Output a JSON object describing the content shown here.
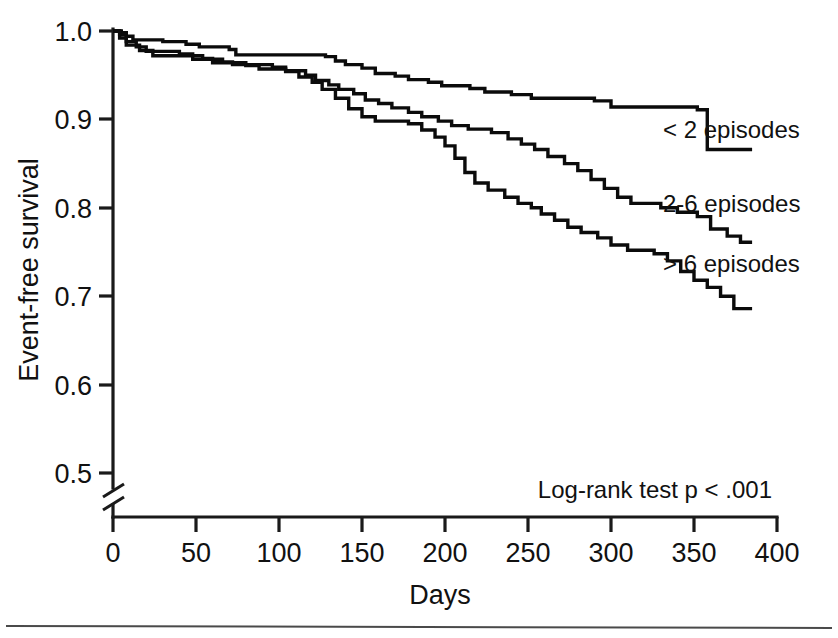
{
  "figure": {
    "title": "",
    "background_color": "#ffffff",
    "line_color": "#0b0b0b",
    "axis_color": "#1a1a1a"
  },
  "axes": {
    "y_title": "Event-free survival",
    "x_title": "Days",
    "y_ticks": [
      "1.0",
      "0.9",
      "0.8",
      "0.7",
      "0.6",
      "0.5"
    ],
    "x_ticks": [
      "0",
      "50",
      "100",
      "150",
      "200",
      "250",
      "300",
      "350",
      "400"
    ],
    "y_axis_break": true
  },
  "annotations": {
    "log_rank": "Log-rank test p < .001"
  },
  "curve_labels": {
    "series_1": "< 2 episodes",
    "series_2": "2-6 episodes",
    "series_3": "> 6 episodes"
  },
  "chart_data": {
    "type": "line",
    "title": "",
    "xlabel": "Days",
    "ylabel": "Event-free survival",
    "xlim": [
      0,
      400
    ],
    "ylim": [
      0.5,
      1.0
    ],
    "y_axis_break_below": 0.5,
    "grid": false,
    "legend_position": "inline-right-of-curves",
    "annotations": [
      "Log-rank test p < .001"
    ],
    "step_type": "post",
    "series": [
      {
        "name": "< 2 episodes",
        "label_position": {
          "x": 320,
          "y": 0.898
        },
        "points": [
          [
            0,
            1.0
          ],
          [
            5,
            0.998
          ],
          [
            8,
            0.994
          ],
          [
            12,
            0.99
          ],
          [
            30,
            0.988
          ],
          [
            44,
            0.985
          ],
          [
            52,
            0.982
          ],
          [
            70,
            0.979
          ],
          [
            74,
            0.973
          ],
          [
            128,
            0.971
          ],
          [
            134,
            0.966
          ],
          [
            140,
            0.962
          ],
          [
            150,
            0.958
          ],
          [
            158,
            0.952
          ],
          [
            170,
            0.949
          ],
          [
            178,
            0.945
          ],
          [
            190,
            0.942
          ],
          [
            198,
            0.938
          ],
          [
            215,
            0.935
          ],
          [
            224,
            0.931
          ],
          [
            240,
            0.928
          ],
          [
            252,
            0.924
          ],
          [
            290,
            0.921
          ],
          [
            300,
            0.914
          ],
          [
            352,
            0.911
          ],
          [
            358,
            0.866
          ],
          [
            385,
            0.866
          ]
        ]
      },
      {
        "name": "2-6 episodes",
        "label_position": {
          "x": 320,
          "y": 0.812
        },
        "points": [
          [
            0,
            1.0
          ],
          [
            4,
            0.996
          ],
          [
            8,
            0.988
          ],
          [
            14,
            0.982
          ],
          [
            20,
            0.977
          ],
          [
            40,
            0.974
          ],
          [
            48,
            0.968
          ],
          [
            66,
            0.965
          ],
          [
            72,
            0.962
          ],
          [
            96,
            0.959
          ],
          [
            104,
            0.955
          ],
          [
            116,
            0.95
          ],
          [
            122,
            0.944
          ],
          [
            130,
            0.939
          ],
          [
            136,
            0.934
          ],
          [
            145,
            0.929
          ],
          [
            152,
            0.922
          ],
          [
            160,
            0.918
          ],
          [
            168,
            0.913
          ],
          [
            178,
            0.908
          ],
          [
            186,
            0.903
          ],
          [
            196,
            0.898
          ],
          [
            204,
            0.893
          ],
          [
            214,
            0.889
          ],
          [
            228,
            0.885
          ],
          [
            238,
            0.878
          ],
          [
            246,
            0.872
          ],
          [
            254,
            0.866
          ],
          [
            262,
            0.858
          ],
          [
            272,
            0.85
          ],
          [
            280,
            0.842
          ],
          [
            288,
            0.832
          ],
          [
            296,
            0.822
          ],
          [
            304,
            0.812
          ],
          [
            312,
            0.805
          ],
          [
            330,
            0.8
          ],
          [
            340,
            0.795
          ],
          [
            352,
            0.79
          ],
          [
            360,
            0.776
          ],
          [
            370,
            0.768
          ],
          [
            378,
            0.761
          ],
          [
            385,
            0.761
          ]
        ]
      },
      {
        "name": "> 6 episodes",
        "label_position": {
          "x": 320,
          "y": 0.742
        },
        "points": [
          [
            0,
            1.0
          ],
          [
            4,
            0.992
          ],
          [
            8,
            0.984
          ],
          [
            16,
            0.978
          ],
          [
            24,
            0.972
          ],
          [
            54,
            0.969
          ],
          [
            60,
            0.964
          ],
          [
            80,
            0.961
          ],
          [
            88,
            0.957
          ],
          [
            104,
            0.954
          ],
          [
            112,
            0.948
          ],
          [
            120,
            0.942
          ],
          [
            126,
            0.934
          ],
          [
            134,
            0.924
          ],
          [
            142,
            0.912
          ],
          [
            150,
            0.903
          ],
          [
            158,
            0.898
          ],
          [
            178,
            0.895
          ],
          [
            186,
            0.888
          ],
          [
            194,
            0.88
          ],
          [
            200,
            0.87
          ],
          [
            206,
            0.856
          ],
          [
            212,
            0.84
          ],
          [
            218,
            0.828
          ],
          [
            226,
            0.82
          ],
          [
            236,
            0.812
          ],
          [
            244,
            0.805
          ],
          [
            252,
            0.8
          ],
          [
            258,
            0.793
          ],
          [
            266,
            0.786
          ],
          [
            274,
            0.778
          ],
          [
            282,
            0.772
          ],
          [
            292,
            0.766
          ],
          [
            300,
            0.758
          ],
          [
            310,
            0.752
          ],
          [
            326,
            0.748
          ],
          [
            334,
            0.74
          ],
          [
            342,
            0.728
          ],
          [
            350,
            0.718
          ],
          [
            358,
            0.71
          ],
          [
            366,
            0.7
          ],
          [
            374,
            0.686
          ],
          [
            385,
            0.686
          ]
        ]
      }
    ]
  }
}
